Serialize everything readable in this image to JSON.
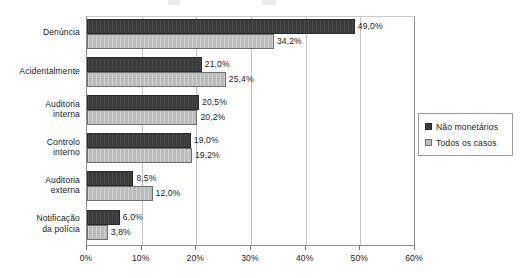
{
  "chart_data": {
    "type": "bar",
    "orientation": "horizontal",
    "title": "",
    "xlabel": "",
    "ylabel": "",
    "xlim": [
      0,
      60
    ],
    "xticks": [
      "0%",
      "10%",
      "20%",
      "30%",
      "40%",
      "50%",
      "60%"
    ],
    "xtick_values": [
      0,
      10,
      20,
      30,
      40,
      50,
      60
    ],
    "grid": "vertical",
    "legend_position": "right",
    "categories": [
      "Denúncia",
      "Acidentalmente",
      "Auditoria interna",
      "Controlo interno",
      "Auditoria externa",
      "Notificação da polícia"
    ],
    "category_lines": [
      [
        "Denúncia"
      ],
      [
        "Acidentalmente"
      ],
      [
        "Auditoria",
        "interna"
      ],
      [
        "Controlo",
        "interno"
      ],
      [
        "Auditoria",
        "externa"
      ],
      [
        "Notificação",
        "da polícia"
      ]
    ],
    "series": [
      {
        "name": "Não monetários",
        "color": "#3c3c3c",
        "values": [
          49.0,
          21.0,
          20.5,
          19.0,
          8.5,
          6.0
        ],
        "labels": [
          "49,0%",
          "21,0%",
          "20,5%",
          "19,0%",
          "8,5%",
          "6,0%"
        ]
      },
      {
        "name": "Todos os casos",
        "color": "#bcbcbc",
        "values": [
          34.2,
          25.4,
          20.2,
          19.2,
          12.0,
          3.8
        ],
        "labels": [
          "34,2%",
          "25,4%",
          "20,2%",
          "19,2%",
          "12,0%",
          "3,8%"
        ]
      }
    ]
  },
  "legend": {
    "items": [
      {
        "label": "Não monetários",
        "swatch": "dark-square-icon"
      },
      {
        "label": "Todos os casos",
        "swatch": "light-square-icon"
      }
    ]
  }
}
